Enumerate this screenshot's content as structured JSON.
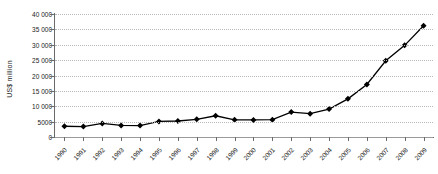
{
  "chart_data": {
    "type": "line",
    "title": "",
    "subtitle": "",
    "xlabel": "",
    "ylabel": "US$ million",
    "categories": [
      "1990",
      "1991",
      "1992",
      "1993",
      "1994",
      "1995",
      "1996",
      "1997",
      "1998",
      "1999",
      "2000",
      "2001",
      "2002",
      "2003",
      "2004",
      "2005",
      "2006",
      "2007",
      "2008",
      "2009"
    ],
    "values": [
      3500,
      3400,
      4400,
      3750,
      3700,
      5050,
      5200,
      5750,
      6900,
      5600,
      5550,
      5650,
      8100,
      7600,
      9100,
      12400,
      17100,
      24800,
      29800,
      36200
    ],
    "series": [
      {
        "name": "US$ million",
        "values": [
          3500,
          3400,
          4400,
          3750,
          3700,
          5050,
          5200,
          5750,
          6900,
          5600,
          5550,
          5650,
          8100,
          7600,
          9100,
          12400,
          17100,
          24800,
          29800,
          36200
        ]
      }
    ],
    "ylim": [
      0,
      40000
    ],
    "ytick_values": [
      0,
      5000,
      10000,
      15000,
      20000,
      25000,
      30000,
      35000,
      40000
    ],
    "ytick_labels": [
      "0",
      "5000",
      "10 000",
      "15 000",
      "20 000",
      "25 000",
      "30 000",
      "35 000",
      "40 000"
    ],
    "grid": "horizontal-dotted",
    "legend": "none",
    "marker": "diamond",
    "marker_color": "#000000",
    "line_color": "#000000",
    "gridline_color": "#b9b9b9",
    "axis_color": "#6a6a6a",
    "background_color": "#ffffff",
    "xtick_label_rotation": -45
  }
}
